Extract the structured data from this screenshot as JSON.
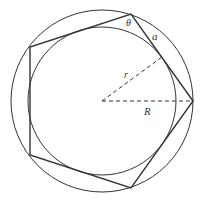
{
  "diagram": {
    "colors": {
      "stroke": "#333333",
      "background": "#ffffff"
    },
    "center": {
      "x": 102,
      "y": 101
    },
    "outer_circle": {
      "radius": 91
    },
    "inner_circle": {
      "radius": 74
    },
    "pentagon": {
      "vertices": [
        [
          193,
          101
        ],
        [
          130,
          14
        ],
        [
          30,
          47
        ],
        [
          30,
          155
        ],
        [
          130,
          188
        ]
      ]
    },
    "labels": {
      "theta": "θ",
      "side": "a",
      "inradius": "r",
      "circumradius": "R"
    }
  }
}
